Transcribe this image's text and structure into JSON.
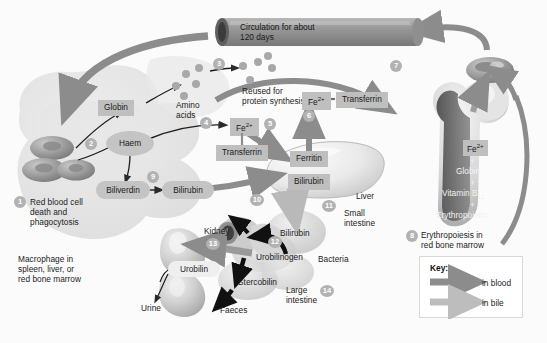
{
  "diagram": {
    "background_color": "#fbfbfb",
    "ink_color": "#1b1b1b",
    "blood_arrow_color": "#8c8c8c",
    "bile_arrow_color": "#b9b9b9",
    "chip_color": "#bfbfbf",
    "badge_color": "#b2b2b2"
  },
  "tube": {
    "line1": "Circulation for about",
    "line2": "120 days"
  },
  "steps": [
    {
      "n": "1",
      "label": "Red blood cell\ndeath and\nphagocytosis"
    },
    {
      "n": "2",
      "label": ""
    },
    {
      "n": "3",
      "label": ""
    },
    {
      "n": "4",
      "label": ""
    },
    {
      "n": "5",
      "label": ""
    },
    {
      "n": "6",
      "label": ""
    },
    {
      "n": "7",
      "label": ""
    },
    {
      "n": "8",
      "label": "Erythropoiesis in\nred bone marrow"
    },
    {
      "n": "9",
      "label": ""
    },
    {
      "n": "10",
      "label": ""
    },
    {
      "n": "11",
      "label": ""
    },
    {
      "n": "12",
      "label": ""
    },
    {
      "n": "13",
      "label": ""
    },
    {
      "n": "14",
      "label": ""
    }
  ],
  "labels": {
    "rbc_death": "Red blood cell\ndeath and\nphagocytosis",
    "macrophage": "Macrophage in\nspleen, liver, or\nred bone marrow",
    "amino_acids": "Amino\nacids",
    "reused": "Reused for\nprotein synthesis",
    "globin": "Globin",
    "haem": "Haem",
    "biliverdin": "Biliverdin",
    "bilirubin": "Bilirubin",
    "transferrin_mid": "Transferrin",
    "fe_mid": "Fe",
    "fe_charge": "2+",
    "fe_top": "Fe",
    "transferrin_top": "Transferrin",
    "ferritin": "Ferritin",
    "bilirubin_liver": "Bilirubin",
    "liver": "Liver",
    "small_intestine": "Small\nintestine",
    "bilirubin_gut": "Bilirubin",
    "urobilinogen": "Urobilinogen",
    "bacteria": "Bacteria",
    "stercobilin": "Stercobilin",
    "faeces": "Faeces",
    "large_intestine": "Large\nintestine",
    "kidney": "Kidney",
    "urobilin": "Urobilin",
    "urine": "Urine",
    "erythropoiesis": "Erythropoiesis in\nred bone marrow",
    "marrow_fe": "Fe",
    "marrow_globin": "Globin",
    "marrow_vitamin": "Vitamin B",
    "marrow_vitamin_sub": "12",
    "marrow_epo": "Erythropoietin",
    "plus": "+"
  },
  "key": {
    "title": "Key:",
    "entries": [
      {
        "label": "in blood",
        "color": "#8c8c8c"
      },
      {
        "label": "in bile",
        "color": "#b9b9b9"
      }
    ]
  }
}
